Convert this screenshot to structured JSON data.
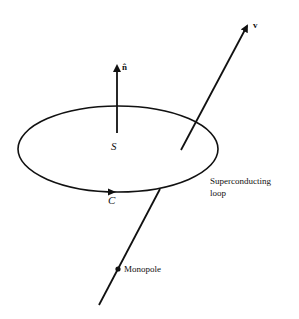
{
  "diagram": {
    "labels": {
      "normal_vector": "n̂",
      "velocity": "v",
      "surface": "S",
      "contour": "C",
      "loop_line1": "Superconducting",
      "loop_line2": "loop",
      "monopole": "Monopole"
    },
    "colors": {
      "stroke": "#111111",
      "background": "#ffffff"
    }
  }
}
